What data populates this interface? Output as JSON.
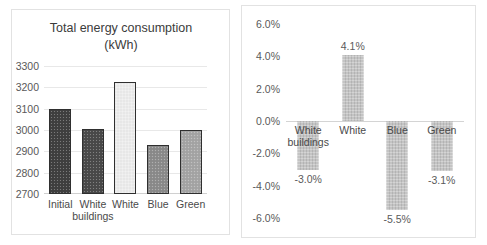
{
  "chart_data": [
    {
      "id": "total-energy",
      "type": "bar",
      "title_line1": "Total energy consumption",
      "title_line2": "(kWh)",
      "xlabel": "",
      "ylabel": "",
      "ylim": [
        2700,
        3300
      ],
      "ytick_step": 100,
      "yticks": [
        "2700",
        "2800",
        "2900",
        "3000",
        "3100",
        "3200",
        "3300"
      ],
      "grid": true,
      "legend": "none",
      "categories": [
        "Initial",
        "White buildings",
        "White",
        "Blue",
        "Green"
      ],
      "category_lines": [
        [
          "Initial"
        ],
        [
          "White",
          "buildings"
        ],
        [
          "White"
        ],
        [
          "Blue"
        ],
        [
          "Green"
        ]
      ],
      "values": [
        3100,
        3005,
        3227,
        2928,
        3000
      ],
      "bar_colors": [
        "#404040",
        "#4a4a4a",
        "#ededed",
        "#8c8c8c",
        "#a6a6a6"
      ],
      "bar_border": "#2f2f2f"
    },
    {
      "id": "energy-change",
      "type": "bar",
      "title": "",
      "xlabel": "",
      "ylabel": "",
      "ylim": [
        -6.0,
        6.0
      ],
      "ytick_step": 2.0,
      "yticks": [
        "6.0%",
        "4.0%",
        "2.0%",
        "0.0%",
        "-2.0%",
        "-4.0%",
        "-6.0%"
      ],
      "grid": false,
      "legend": "none",
      "categories": [
        "White buildings",
        "White",
        "Blue",
        "Green"
      ],
      "category_lines": [
        [
          "White",
          "buildings"
        ],
        [
          "White"
        ],
        [
          "Blue"
        ],
        [
          "Green"
        ]
      ],
      "values": [
        -3.0,
        4.1,
        -5.5,
        -3.1
      ],
      "data_labels": [
        "-3.0%",
        "4.1%",
        "-5.5%",
        "-3.1%"
      ],
      "bar_color": "#c4c4c4"
    }
  ]
}
